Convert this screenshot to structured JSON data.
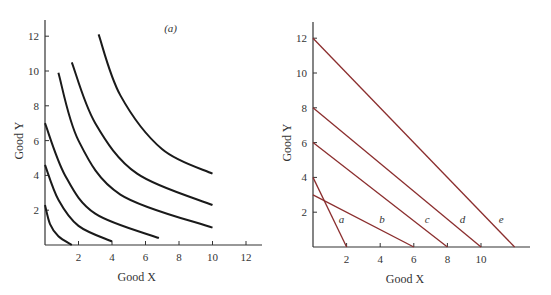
{
  "chart_data": [
    {
      "type": "line",
      "panel": "left",
      "title": "(a)",
      "xlabel": "Good X",
      "ylabel": "Good Y",
      "xlim": [
        0,
        13
      ],
      "ylim": [
        0,
        13
      ],
      "xticks": [
        "2",
        "4",
        "6",
        "8",
        "10",
        "12"
      ],
      "yticks": [
        "2",
        "4",
        "6",
        "8",
        "10",
        "12"
      ],
      "grid": false,
      "line_color": "#1a1a1a",
      "series": [
        {
          "name": "curve-1",
          "points": [
            [
              0,
              2.3
            ],
            [
              0.3,
              1.2
            ],
            [
              0.8,
              0.5
            ],
            [
              1.6,
              0
            ]
          ]
        },
        {
          "name": "curve-2",
          "points": [
            [
              0,
              4.6
            ],
            [
              0.8,
              2.6
            ],
            [
              2,
              1.1
            ],
            [
              4,
              0.2
            ]
          ]
        },
        {
          "name": "curve-3",
          "points": [
            [
              0,
              7
            ],
            [
              1.2,
              4
            ],
            [
              3,
              1.8
            ],
            [
              6.8,
              0.4
            ]
          ]
        },
        {
          "name": "curve-4",
          "points": [
            [
              0.8,
              9.9
            ],
            [
              2,
              6
            ],
            [
              4.5,
              2.9
            ],
            [
              10,
              1
            ]
          ]
        },
        {
          "name": "curve-5",
          "points": [
            [
              1.6,
              10.5
            ],
            [
              3,
              7
            ],
            [
              5.5,
              4.1
            ],
            [
              10,
              2.3
            ]
          ]
        },
        {
          "name": "curve-6",
          "points": [
            [
              3.2,
              12.1
            ],
            [
              4.5,
              8.6
            ],
            [
              7,
              5.5
            ],
            [
              10,
              4.1
            ]
          ]
        }
      ]
    },
    {
      "type": "line",
      "panel": "right",
      "title": "",
      "xlabel": "Good X",
      "ylabel": "Good Y",
      "xlim": [
        0,
        13
      ],
      "ylim": [
        0,
        13
      ],
      "xticks": [
        "2",
        "4",
        "6",
        "8",
        "10"
      ],
      "yticks": [
        "2",
        "4",
        "6",
        "8",
        "10",
        "12"
      ],
      "grid": false,
      "line_color": "#8b2e2e",
      "series": [
        {
          "name": "a",
          "points": [
            [
              0,
              4
            ],
            [
              2,
              0
            ]
          ],
          "label_pos": [
            1.7,
            1.4
          ]
        },
        {
          "name": "b",
          "points": [
            [
              0,
              3
            ],
            [
              6,
              0
            ]
          ],
          "label_pos": [
            4.1,
            1.4
          ]
        },
        {
          "name": "c",
          "points": [
            [
              0,
              6
            ],
            [
              8,
              0
            ]
          ],
          "label_pos": [
            6.8,
            1.4
          ]
        },
        {
          "name": "d",
          "points": [
            [
              0,
              8
            ],
            [
              10,
              0
            ]
          ],
          "label_pos": [
            8.9,
            1.4
          ]
        },
        {
          "name": "e",
          "points": [
            [
              0,
              12
            ],
            [
              12,
              0
            ]
          ],
          "label_pos": [
            11.2,
            1.4
          ]
        }
      ]
    }
  ]
}
